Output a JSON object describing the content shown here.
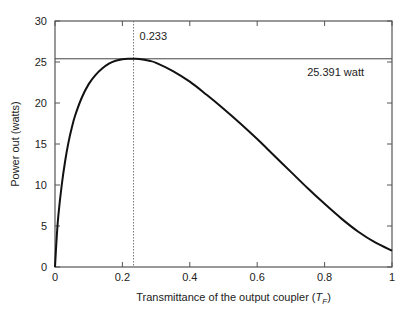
{
  "chart_data": {
    "type": "line",
    "title": "",
    "xlabel": "Transmittance of the output coupler (",
    "xlabel_symbol": "T",
    "xlabel_subscript": "F",
    "xlabel_close": ")",
    "ylabel": "Power out (watts)",
    "xlim": [
      0,
      1
    ],
    "ylim": [
      0,
      30
    ],
    "xticks": [
      0,
      0.2,
      0.4,
      0.6,
      0.8,
      1
    ],
    "xtick_labels": [
      "0",
      "0.2",
      "0.4",
      "0.6",
      "0.8",
      "1"
    ],
    "yticks": [
      0,
      5,
      10,
      15,
      20,
      25,
      30
    ],
    "ytick_labels": [
      "0",
      "5",
      "10",
      "15",
      "20",
      "25",
      "30"
    ],
    "grid": false,
    "series": [
      {
        "name": "Power out",
        "color": "#111111",
        "x": [
          0,
          0.005,
          0.01,
          0.02,
          0.03,
          0.04,
          0.05,
          0.06,
          0.08,
          0.1,
          0.12,
          0.14,
          0.16,
          0.18,
          0.2,
          0.22,
          0.233,
          0.25,
          0.28,
          0.3,
          0.35,
          0.4,
          0.45,
          0.5,
          0.55,
          0.6,
          0.65,
          0.7,
          0.75,
          0.8,
          0.85,
          0.9,
          0.95,
          1.0
        ],
        "y": [
          0,
          3.6,
          6.3,
          10.0,
          12.9,
          15.2,
          17.0,
          18.5,
          20.7,
          22.3,
          23.4,
          24.2,
          24.8,
          25.15,
          25.33,
          25.39,
          25.391,
          25.37,
          25.15,
          24.9,
          23.9,
          22.6,
          21.0,
          19.3,
          17.5,
          15.6,
          13.6,
          11.6,
          9.6,
          7.7,
          5.9,
          4.3,
          3.0,
          2.0
        ]
      }
    ],
    "annotations": {
      "optimum_x": 0.233,
      "optimum_x_label": "0.233",
      "max_power": 25.391,
      "max_power_label": "25.391 watt"
    }
  }
}
